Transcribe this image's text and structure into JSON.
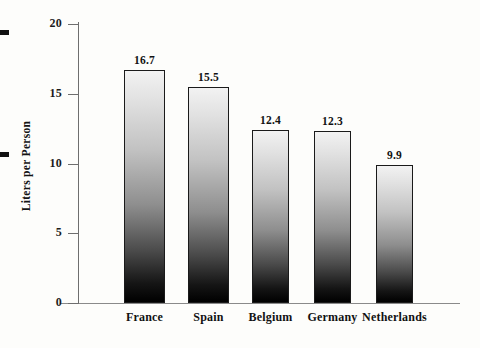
{
  "chart_data": {
    "type": "bar",
    "title": "",
    "subtitle": "",
    "xlabel": "",
    "ylabel": "Liters per Person",
    "categories": [
      "France",
      "Spain",
      "Belgium",
      "Germany",
      "Netherlands"
    ],
    "values": [
      16.7,
      15.5,
      12.4,
      12.3,
      9.9
    ],
    "value_labels": [
      "16.7",
      "15.5",
      "12.4",
      "12.3",
      "9.9"
    ],
    "ylim": [
      0,
      20
    ],
    "yticks": [
      0,
      5,
      10,
      15,
      20
    ],
    "ytick_labels": [
      "0",
      "5",
      "10",
      "15",
      "20"
    ],
    "grid": false,
    "legend": null,
    "legend_position": "none",
    "series": [
      {
        "name": "Liters per Person",
        "values": [
          16.7,
          15.5,
          12.4,
          12.3,
          9.9
        ]
      }
    ],
    "bar_style": {
      "fill": "vertical-gradient-light-top-to-black-bottom",
      "top_color": "#f2f2f2",
      "bottom_color": "#000000",
      "border_color": "#1a1a1a"
    },
    "axis_color": "#6e6e6e",
    "text_color": "#121212",
    "background_color": "#fdfdfb"
  },
  "marks": {
    "top_edge_mark": "scan-edge-mark",
    "mid_edge_mark": "scan-edge-mark"
  }
}
